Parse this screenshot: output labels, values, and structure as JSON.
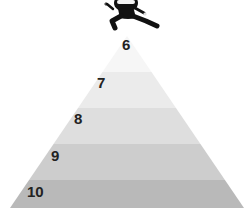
{
  "diagram": {
    "type": "pyramid",
    "apex": {
      "x": 127,
      "y": 36
    },
    "base": {
      "y": 208,
      "left_x": 10,
      "right_x": 244
    },
    "levels": [
      {
        "label": "6",
        "top": 36,
        "bottom": 72,
        "color": "#f6f6f6",
        "label_x": 122,
        "label_y": 37
      },
      {
        "label": "7",
        "top": 72,
        "bottom": 108,
        "color": "#ebebeb",
        "label_x": 97,
        "label_y": 75
      },
      {
        "label": "8",
        "top": 108,
        "bottom": 144,
        "color": "#dedede",
        "label_x": 74,
        "label_y": 111
      },
      {
        "label": "9",
        "top": 144,
        "bottom": 180,
        "color": "#cdcdcd",
        "label_x": 51,
        "label_y": 148
      },
      {
        "label": "10",
        "top": 180,
        "bottom": 208,
        "color": "#b9b9b9",
        "label_x": 27,
        "label_y": 184
      }
    ]
  },
  "figure": {
    "icon": "ninja-icon",
    "position": "top-of-pyramid"
  }
}
